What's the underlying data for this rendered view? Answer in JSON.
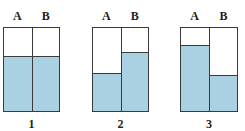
{
  "diagram": {
    "colors": {
      "water": "#a9d1e2",
      "outline": "#3a3a3a"
    },
    "containers": [
      {
        "number": "1",
        "left_label": "A",
        "right_label": "B",
        "x": 3,
        "y": 27,
        "width": 57,
        "height": 85,
        "divider_x": 28,
        "level_a": 54,
        "level_b": 54
      },
      {
        "number": "2",
        "left_label": "A",
        "right_label": "B",
        "x": 92,
        "y": 27,
        "width": 57,
        "height": 85,
        "divider_x": 28,
        "level_a": 37,
        "level_b": 58
      },
      {
        "number": "3",
        "left_label": "A",
        "right_label": "B",
        "x": 180,
        "y": 27,
        "width": 58,
        "height": 85,
        "divider_x": 28,
        "level_a": 65,
        "level_b": 35
      }
    ]
  }
}
